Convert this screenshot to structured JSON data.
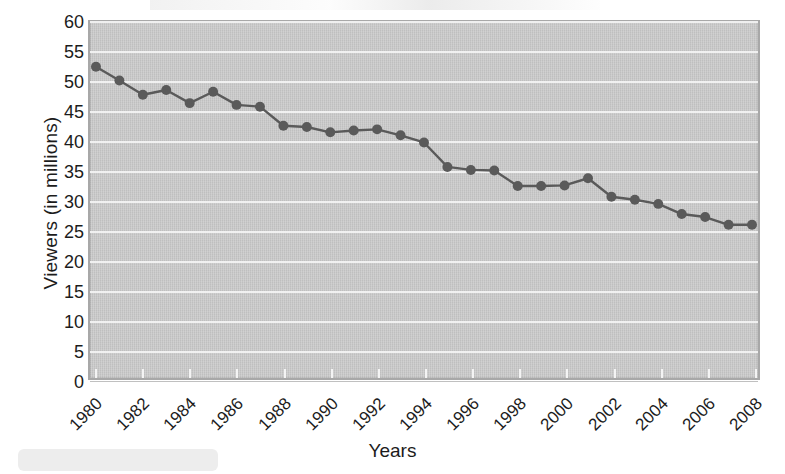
{
  "figure": {
    "background_color": "#ffffff",
    "plot_background_color": "#c9c9c9",
    "gridline_color": "#f2f2f2",
    "series_color": "#5a5a5a"
  },
  "axis": {
    "y_title": "Viewers (in millions)",
    "x_title": "Years",
    "y_ticks": [
      "0",
      "5",
      "10",
      "15",
      "20",
      "25",
      "30",
      "35",
      "40",
      "45",
      "50",
      "55",
      "60"
    ],
    "x_ticks": [
      "1980",
      "1982",
      "1984",
      "1986",
      "1988",
      "1990",
      "1992",
      "1994",
      "1996",
      "1998",
      "2000",
      "2002",
      "2004",
      "2006",
      "2008"
    ]
  },
  "chart_data": {
    "type": "line",
    "title": "",
    "subtitle": "",
    "xlabel": "Years",
    "ylabel": "Viewers (in millions)",
    "xlim": [
      1980,
      2008
    ],
    "ylim": [
      0,
      60
    ],
    "ytick_step": 5,
    "xtick_step": 2,
    "grid": true,
    "legend": "none",
    "marker": "circle",
    "x": [
      1980,
      1981,
      1982,
      1983,
      1984,
      1985,
      1986,
      1987,
      1988,
      1989,
      1990,
      1991,
      1992,
      1993,
      1994,
      1995,
      1996,
      1997,
      1998,
      1999,
      2000,
      2001,
      2002,
      2003,
      2004,
      2005,
      2006,
      2007,
      2008
    ],
    "values": [
      52.5,
      50.2,
      47.8,
      48.6,
      46.4,
      48.3,
      46.1,
      45.8,
      42.6,
      42.4,
      41.5,
      41.8,
      42.0,
      41.0,
      39.8,
      35.7,
      35.2,
      35.1,
      32.5,
      32.5,
      32.6,
      33.8,
      30.7,
      30.2,
      29.5,
      27.8,
      27.3,
      26.0,
      26.0
    ],
    "series": [
      {
        "name": "Viewers",
        "color": "#5a5a5a",
        "values": [
          52.5,
          50.2,
          47.8,
          48.6,
          46.4,
          48.3,
          46.1,
          45.8,
          42.6,
          42.4,
          41.5,
          41.8,
          42.0,
          41.0,
          39.8,
          35.7,
          35.2,
          35.1,
          32.5,
          32.5,
          32.6,
          33.8,
          30.7,
          30.2,
          29.5,
          27.8,
          27.3,
          26.0,
          26.0
        ]
      }
    ]
  }
}
